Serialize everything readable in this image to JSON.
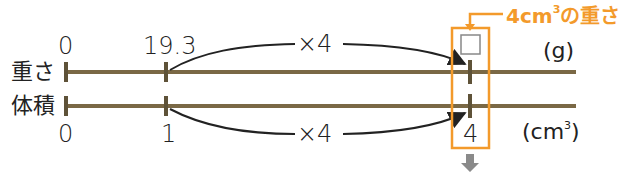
{
  "colors": {
    "line": "#7a6845",
    "arrow": "#222222",
    "highlight": "#f39a2b",
    "down_arrow": "#8a8a8a",
    "answer_box": "#888888"
  },
  "diagram": {
    "top_row": {
      "label": "重さ",
      "unit": "(g)",
      "ticks": [
        "0",
        "19.3",
        "□"
      ]
    },
    "bottom_row": {
      "label": "体積",
      "unit_base": "(cm",
      "unit_sup": "3",
      "unit_close": ")",
      "ticks": [
        "0",
        "1",
        "4"
      ]
    },
    "multipliers": {
      "top": "×4",
      "bottom": "×4"
    },
    "callout": {
      "prefix": "4cm",
      "sup": "3",
      "suffix": "の重さ"
    }
  }
}
